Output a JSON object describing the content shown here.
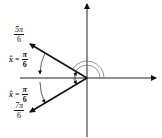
{
  "diagram": {
    "type": "angle-diagram",
    "axes": {
      "horizontal": true,
      "vertical": true,
      "origin": [
        87,
        78
      ]
    },
    "rays": [
      {
        "name": "ray-5pi-6",
        "angle_label_num": "5π",
        "angle_label_den": "6"
      },
      {
        "name": "ray-7pi-6",
        "angle_label_num": "7π",
        "angle_label_den": "6"
      }
    ],
    "reference_angles": [
      {
        "var": "x̂",
        "eq": "=",
        "num": "π",
        "den": "6"
      },
      {
        "var": "x̂",
        "eq": "=",
        "num": "π",
        "den": "6"
      }
    ],
    "colors": {
      "stroke": "#111111",
      "arc": "#555555",
      "background": "#ffffff"
    }
  }
}
